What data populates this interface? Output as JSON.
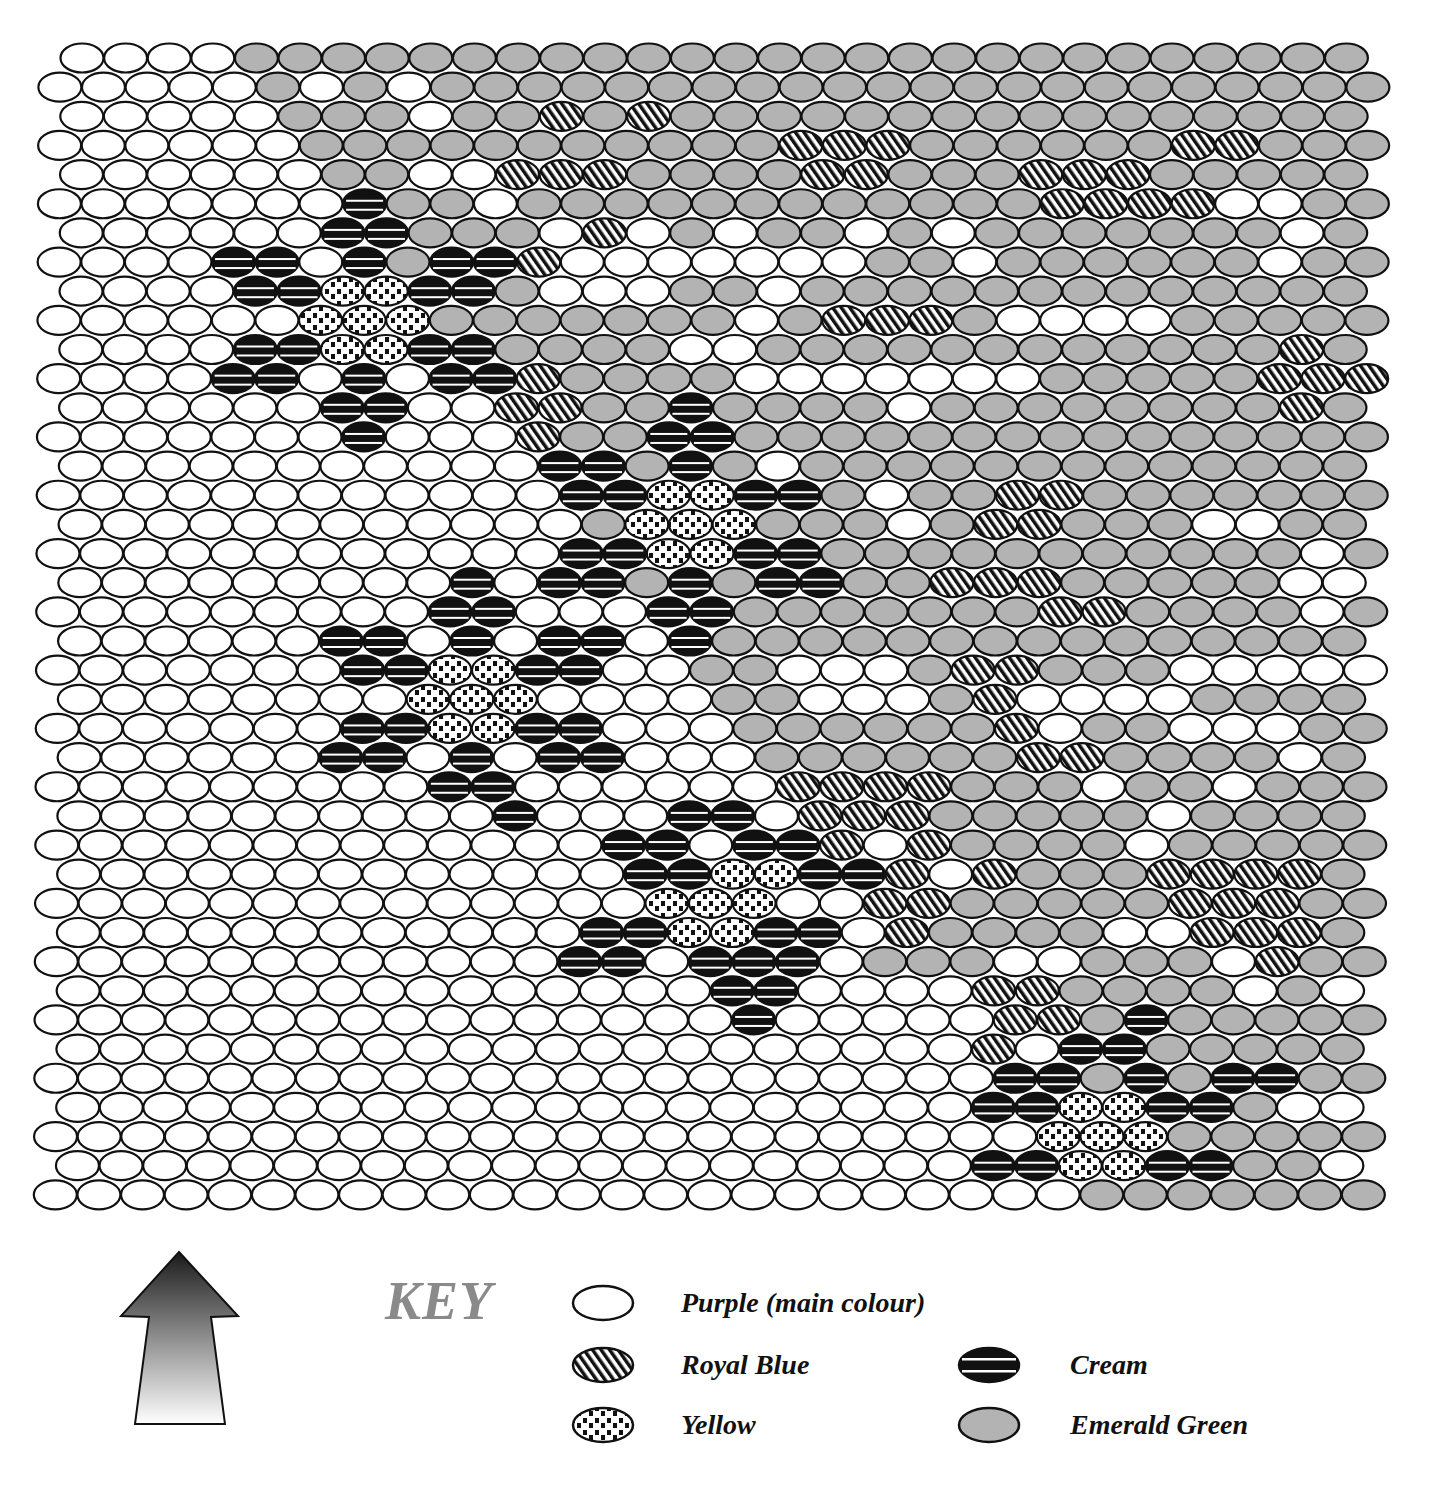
{
  "diagram": {
    "type": "bead-pattern-chart",
    "codes": {
      "P": "purple",
      "G": "emerald-green",
      "B": "royal-blue",
      "C": "cream",
      "Y": "yellow"
    },
    "rows": [
      "PPPPGGGGGGGGGGGGGGGGGGGGGGGGGG",
      "PPPPPGPGPGGGGGGGGGGGGGGGGGGGGGG",
      "PPPPPGGGPGGBGBGGGGGGGGGGGGGGGG",
      "PPPPPPGGGGGGGGGGGBBBGGGGGGBBGGG",
      "PPPPPPGGPPBBBGGGGBBGGGBBBGGGGG",
      "PPPPPPPCGGPGGGGGGGGGGGGBBBBPPGG",
      "PPPPPPCCGGGPBPGPGGPGPGGGGGGGPG",
      "PPPPCCPCGCCBPPPPPPPGGPGGGGGGPGG",
      "PPPPCCYYCCGPPPGGPGGGGGGGGGGGGG",
      "PPPPPPYYYGGGGGGGPGBBBGPPPPGGGGG",
      "PPPPCCYYCCGGGGPPGGGGGGGGGGGGBG",
      "PPPPCCPCPCCBGGGGPPPPPPPGGGGGBBB",
      "PPPPPPCCPPBBGGCGGGGPGGGGGGGGBG",
      "PPPPPPPCPPPBGGCCGGGGGGGGGGGGGGG",
      "PPPPPPPPPPPCCGCGPGGGGGGGGGGGGG",
      "PPPPPPPPPPPPCCYYCCGPGGBBGGGGGGG",
      "PPPPPPPPPPPPGYYYGGGPGBBGGGPPGG",
      "PPPPPPPPPPPPCCYYCCGGGGGGGGGGGPG",
      "PPPPPPPPPCPCCGCGCCGGBBBGGGGGPP",
      "PPPPPPPPPCCPPPCCGGGGGGGBBGGGGPG",
      "PPPPPPCCPCPCCPCGGGGGGGGGGGGGGG",
      "PPPPPPPCCYYCCPPGGPPPGBBGGGPPPPP",
      "PPPPPPPPYYYPPPPGGPPPGBPPPPGGGG",
      "PPPPPPPCCYYCCPPPGGGGGGBPGGPPPGG",
      "PPPPPPCCPCPCCPPPGGGGGGBBGGGGPG",
      "PPPPPPPPPCCPPPPPPBBBBGGGPGGPGGG",
      "PPPPPPPPPPCPPPCCPBBBGGGGGPGGGG",
      "PPPPPPPPPPPPPCCPCCBPBGGGGPGGGGG",
      "PPPPPPPPPPPPPCCYYCCBPBGGGBBBBG",
      "PPPPPPPPPPPPPPYYYPPBBGGGGGBBBGG",
      "PPPPPPPPPPPPCCYYCCPBGGGGPPBBBG",
      "PPPPPPPPPPPPCCPCCCPGGGPPGGGPBGG",
      "PPPPPPPPPPPPPPPCCPPPPBBGGGGPGP",
      "PPPPPPPPPPPPPPPPCPPPPPBBGCGGGGG",
      "PPPPPPPPPPPPPPPPPPPPPBPCCGGGGG",
      "PPPPPPPPPPPPPPPPPPPPPPCCGCGCCGG",
      "PPPPPPPPPPPPPPPPPPPPPCCYYCCGPP",
      "PPPPPPPPPPPPPPPPPPPPPPPYYYGGGGG",
      "PPPPPPPPPPPPPPPPPPPPPCCYYCCGGP",
      "PPPPPPPPPPPPPPPPPPPPPPPPGGGGGGG"
    ]
  },
  "key": {
    "title": "KEY",
    "items": [
      {
        "code": "P",
        "label": "Purple (main colour)"
      },
      {
        "code": "B",
        "label": "Royal Blue"
      },
      {
        "code": "Y",
        "label": "Yellow"
      },
      {
        "code": "C",
        "label": "Cream"
      },
      {
        "code": "G",
        "label": "Emerald Green"
      }
    ]
  },
  "colors": {
    "green_fill": "#b3b3b3",
    "outline": "#111111",
    "key_title": "#8a8a8a"
  }
}
